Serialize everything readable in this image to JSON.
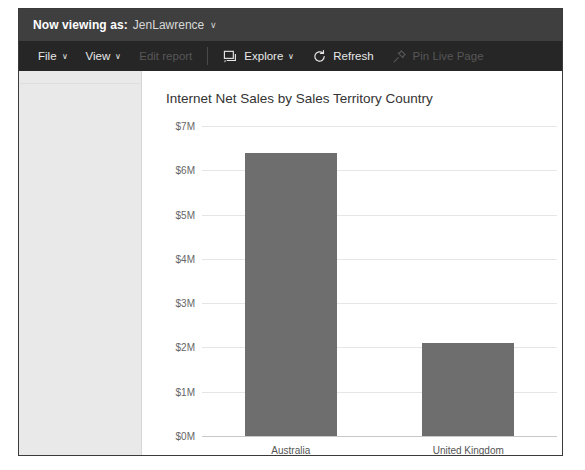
{
  "viewing_bar": {
    "label": "Now viewing as:",
    "user": "JenLawrence",
    "caret": "∨"
  },
  "toolbar": {
    "items": [
      {
        "name": "file",
        "label": "File",
        "icon": "",
        "caret": "∨",
        "disabled": false,
        "separator_after": false
      },
      {
        "name": "view",
        "label": "View",
        "icon": "",
        "caret": "∨",
        "disabled": false,
        "separator_after": false
      },
      {
        "name": "edit-report",
        "label": "Edit report",
        "icon": "",
        "caret": "",
        "disabled": true,
        "separator_after": true
      },
      {
        "name": "explore",
        "label": "Explore",
        "icon": "explore-icon",
        "caret": "∨",
        "disabled": false,
        "separator_after": false
      },
      {
        "name": "refresh",
        "label": "Refresh",
        "icon": "refresh-icon",
        "caret": "",
        "disabled": false,
        "separator_after": false
      },
      {
        "name": "pin-live-page",
        "label": "Pin Live Page",
        "icon": "pin-icon",
        "caret": "",
        "disabled": true,
        "separator_after": false
      }
    ]
  },
  "left_panel": {
    "content": ""
  },
  "chart_data": {
    "type": "bar",
    "title": "Internet Net Sales by Sales Territory Country",
    "xlabel": "",
    "ylabel": "",
    "categories": [
      "Australia",
      "United Kingdom"
    ],
    "values": [
      6.4,
      2.1
    ],
    "value_unit": "M",
    "ylim": [
      0,
      7
    ],
    "ytick_values": [
      0,
      1,
      2,
      3,
      4,
      5,
      6,
      7
    ],
    "ytick_labels": [
      "$0M",
      "$1M",
      "$2M",
      "$3M",
      "$4M",
      "$5M",
      "$6M",
      "$7M"
    ],
    "grid": true,
    "legend": false,
    "bar_color": "#6e6e6e",
    "grid_color": "#e6e6e6",
    "axis_color": "#c9c9c9"
  }
}
